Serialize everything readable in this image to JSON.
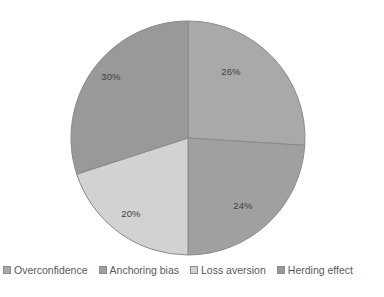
{
  "chart_data": {
    "type": "pie",
    "title": "",
    "subtitle": "",
    "xlabel": "",
    "ylabel": "",
    "legend_position": "bottom",
    "grid": false,
    "start_angle_deg": 0,
    "direction": "clockwise",
    "categories": [
      "Overconfidence",
      "Anchoring bias",
      "Loss aversion",
      "Herding effect"
    ],
    "values": [
      26,
      24,
      20,
      30
    ],
    "value_unit": "%",
    "data_labels": [
      "26%",
      "24%",
      "20%",
      "30%"
    ],
    "colors": [
      "#a9a9a9",
      "#a0a0a0",
      "#d2d2d2",
      "#999999"
    ],
    "slices": [
      {
        "label": "Overconfidence",
        "value": 26,
        "data_label": "26%",
        "color": "#a9a9a9",
        "start_deg": 0,
        "end_deg": 93.6,
        "label_x": 231,
        "label_y": 72
      },
      {
        "label": "Anchoring bias",
        "value": 24,
        "data_label": "24%",
        "color": "#a0a0a0",
        "start_deg": 93.6,
        "end_deg": 180,
        "label_x": 243,
        "label_y": 206
      },
      {
        "label": "Loss aversion",
        "value": 20,
        "data_label": "20%",
        "color": "#d2d2d2",
        "start_deg": 180,
        "end_deg": 252,
        "label_x": 131,
        "label_y": 214
      },
      {
        "label": "Herding effect",
        "value": 30,
        "data_label": "30%",
        "color": "#999999",
        "start_deg": 252,
        "end_deg": 360,
        "label_x": 111,
        "label_y": 77
      }
    ],
    "geometry": {
      "center_x": 188,
      "center_y": 138,
      "radius": 117
    },
    "style": {
      "background": "#ffffff",
      "slice_border": "#8a8a8a",
      "label_color": "#3f3f3f",
      "legend_text_color": "#595959"
    }
  },
  "legend": {
    "items": [
      {
        "label": "Overconfidence",
        "color": "#a9a9a9"
      },
      {
        "label": "Anchoring bias",
        "color": "#a0a0a0"
      },
      {
        "label": "Loss aversion",
        "color": "#d2d2d2"
      },
      {
        "label": "Herding effect",
        "color": "#999999"
      }
    ]
  }
}
